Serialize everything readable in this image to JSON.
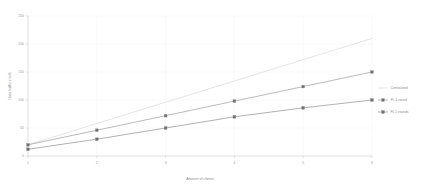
{
  "chart_data": {
    "type": "line",
    "title": "",
    "xlabel": "Amount of clients",
    "ylabel": "Data traffic in kiB",
    "x": [
      1,
      2,
      3,
      4,
      5,
      6
    ],
    "xlim": [
      1,
      6
    ],
    "ylim": [
      0,
      250
    ],
    "xticks": [
      "1",
      "2",
      "3",
      "4",
      "5",
      "6"
    ],
    "yticks": [
      "0",
      "50",
      "100",
      "150",
      "200",
      "250"
    ],
    "grid": true,
    "legend_position": "right",
    "series": [
      {
        "name": "Centralized",
        "color": "#d9d9d9",
        "marker": "none",
        "values": [
          20,
          58,
          96,
          134,
          172,
          210
        ]
      },
      {
        "name": "FL 1 round",
        "color": "#9c9c9c",
        "marker": "square",
        "values": [
          20,
          46,
          72,
          98,
          124,
          150
        ]
      },
      {
        "name": "FL 2 rounds",
        "color": "#8f8f8f",
        "marker": "square",
        "values": [
          12,
          30,
          50,
          70,
          86,
          100
        ]
      }
    ]
  },
  "legend": {
    "entries": [
      {
        "label": "Centralized"
      },
      {
        "label": "FL 1 round"
      },
      {
        "label": "FL 2 rounds"
      }
    ]
  },
  "axes": {
    "x_title": "Amount of clients",
    "y_title": "Data traffic in kiB"
  }
}
